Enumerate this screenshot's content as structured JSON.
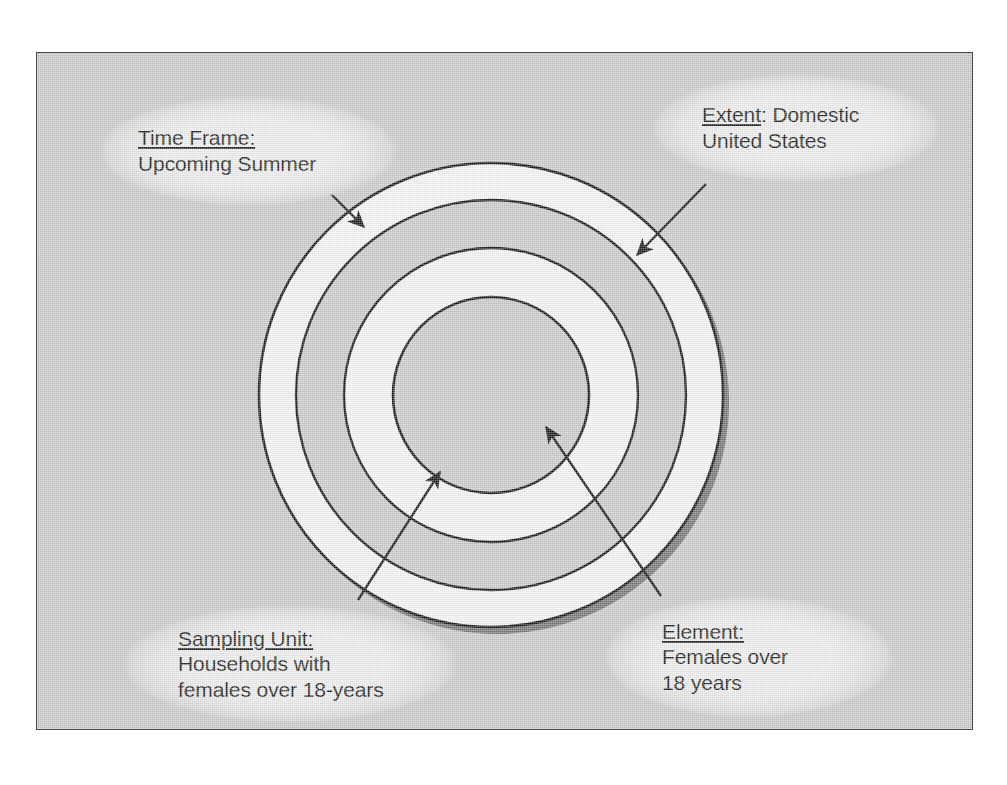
{
  "figure": {
    "type": "concentric-circles-sampling-diagram",
    "background_color": "#c9c9c9",
    "border_color": "#4a4a4a",
    "ring_light_color": "#f2f2f2",
    "ring_dark_color": "#c9c9c9",
    "outline_color": "#1a1a1a",
    "shadow_color": "#3a3a3a",
    "center": {
      "x": 491,
      "y": 395
    },
    "rings": [
      {
        "index": 1,
        "name": "time-frame-ring",
        "radius": 232,
        "fill": "light",
        "label": "Time Frame"
      },
      {
        "index": 2,
        "name": "extent-ring",
        "radius": 195,
        "fill": "dark",
        "label": "Extent"
      },
      {
        "index": 3,
        "name": "sampling-unit-ring",
        "radius": 147,
        "fill": "light",
        "label": "Sampling Unit"
      },
      {
        "index": 4,
        "name": "element-core",
        "radius": 98,
        "fill": "dark",
        "label": "Element"
      }
    ]
  },
  "callouts": {
    "time_frame": {
      "heading": "Time Frame:",
      "lines": [
        "Upcoming Summer"
      ],
      "arrow": {
        "from": {
          "x": 300,
          "y": 163
        },
        "to": {
          "x": 364,
          "y": 227
        }
      }
    },
    "extent": {
      "heading": "Extent: Domestic",
      "lines": [
        "United States"
      ],
      "heading_underlined_part": "Extent",
      "heading_rest": ": Domestic",
      "arrow": {
        "from": {
          "x": 706,
          "y": 184
        },
        "to": {
          "x": 637,
          "y": 255
        }
      }
    },
    "sampling_unit": {
      "heading": "Sampling Unit:",
      "lines": [
        "Households with",
        "females over 18-years"
      ],
      "arrow": {
        "from": {
          "x": 358,
          "y": 600
        },
        "to": {
          "x": 440,
          "y": 472
        }
      }
    },
    "element": {
      "heading": "Element:",
      "lines": [
        "Females over",
        "18 years"
      ],
      "arrow": {
        "from": {
          "x": 661,
          "y": 596
        },
        "to": {
          "x": 546,
          "y": 427
        }
      }
    }
  }
}
